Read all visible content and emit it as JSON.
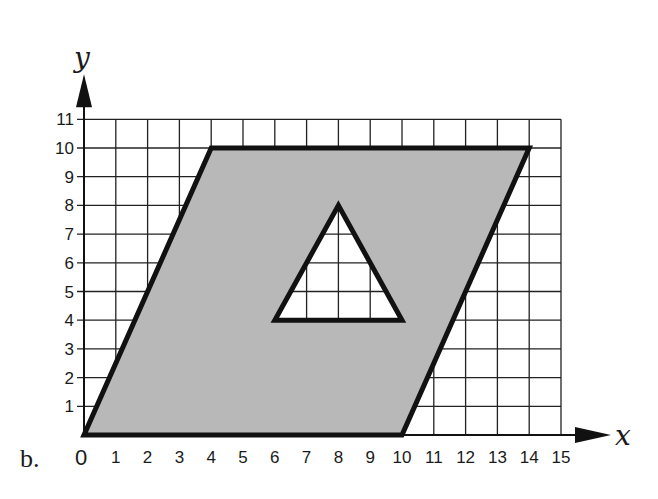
{
  "figure": {
    "sub_label": "b.",
    "x_axis_label": "x",
    "y_axis_label": "y",
    "origin_label": "0",
    "x_ticks": [
      "1",
      "2",
      "3",
      "4",
      "5",
      "6",
      "7",
      "8",
      "9",
      "10",
      "11",
      "12",
      "13",
      "14",
      "15"
    ],
    "y_ticks": [
      "1",
      "2",
      "3",
      "4",
      "5",
      "6",
      "7",
      "8",
      "9",
      "10",
      "11"
    ],
    "colors": {
      "fill": "#b8b8b8",
      "stroke": "#111111",
      "grid": "#222222",
      "hole": "#ffffff"
    }
  },
  "chart_data": {
    "type": "diagram",
    "title": "",
    "xlabel": "x",
    "ylabel": "y",
    "xlim": [
      0,
      15
    ],
    "ylim": [
      0,
      11
    ],
    "grid": true,
    "shapes": [
      {
        "name": "parallelogram",
        "fill": "gray",
        "vertices": [
          [
            0,
            0
          ],
          [
            4,
            10
          ],
          [
            14,
            10
          ],
          [
            10,
            0
          ]
        ]
      },
      {
        "name": "triangle-hole",
        "fill": "white",
        "vertices": [
          [
            6,
            4
          ],
          [
            10,
            4
          ],
          [
            8,
            8
          ]
        ]
      }
    ]
  }
}
